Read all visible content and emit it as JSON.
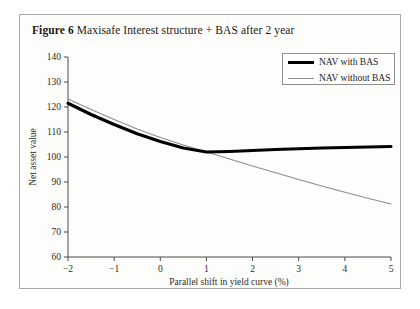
{
  "figure": {
    "number_label": "Figure 6",
    "caption": "Maxisafe Interest structure + BAS after 2 year"
  },
  "legend": {
    "position": "top-right",
    "entries": [
      {
        "label": "NAV with BAS",
        "color": "#000000",
        "style": "thick-solid"
      },
      {
        "label": "NAV without BAS",
        "color": "#8d8d8d",
        "style": "thin-solid"
      }
    ]
  },
  "chart_data": {
    "type": "line",
    "title": "Maxisafe Interest structure + BAS after 2 year",
    "xlabel": "Parallel shift in yield curve (%)",
    "ylabel": "Net asset value",
    "xlim": [
      -2,
      5
    ],
    "ylim": [
      60,
      140
    ],
    "xticks": [
      -2,
      -1,
      0,
      1,
      2,
      3,
      4,
      5
    ],
    "xticklabels": [
      "−2",
      "−1",
      "0",
      "1",
      "2",
      "3",
      "4",
      "5"
    ],
    "yticks": [
      60,
      70,
      80,
      90,
      100,
      110,
      120,
      130,
      140
    ],
    "yticklabels": [
      "60",
      "70",
      "80",
      "90",
      "100",
      "110",
      "120",
      "130",
      "140"
    ],
    "grid": false,
    "x": [
      -2,
      -1.5,
      -1,
      -0.5,
      0,
      0.5,
      1,
      1.5,
      2,
      2.5,
      3,
      3.5,
      4,
      4.5,
      5
    ],
    "series": [
      {
        "name": "NAV with BAS",
        "color": "#000000",
        "linewidth": 3.1,
        "values": [
          121.5,
          117.0,
          113.0,
          109.3,
          106.2,
          103.6,
          102.0,
          102.2,
          102.6,
          103.0,
          103.3,
          103.6,
          103.8,
          104.0,
          104.2
        ]
      },
      {
        "name": "NAV without BAS",
        "color": "#8d8d8d",
        "linewidth": 1.1,
        "values": [
          123.2,
          119.0,
          115.0,
          111.2,
          107.8,
          104.8,
          102.0,
          99.2,
          96.4,
          93.7,
          91.0,
          88.4,
          85.9,
          83.5,
          81.2
        ]
      }
    ]
  }
}
